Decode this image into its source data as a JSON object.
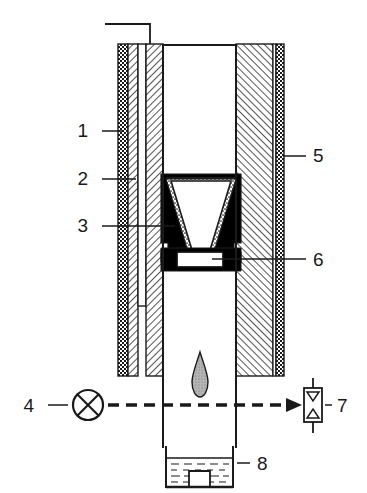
{
  "figure": {
    "type": "technical-line-drawing",
    "background_color": "#ffffff",
    "line_color": "#1a1a1a"
  },
  "callouts": [
    {
      "id": "1",
      "label": "1",
      "side": "left",
      "text_x": 88,
      "text_y": 137,
      "leader_x1": 102,
      "leader_x2": 124,
      "leader_y": 131,
      "target": "outer-checkered-jacket"
    },
    {
      "id": "2",
      "label": "2",
      "side": "left",
      "text_x": 88,
      "text_y": 185,
      "leader_x1": 102,
      "leader_x2": 136,
      "leader_y": 179,
      "target": "inner-hatched-liner"
    },
    {
      "id": "3",
      "label": "3",
      "side": "left",
      "text_x": 88,
      "text_y": 232,
      "leader_x1": 102,
      "leader_x2": 175,
      "leader_y": 226,
      "target": "stippled-cone-packing"
    },
    {
      "id": "4",
      "label": "4",
      "side": "left",
      "text_x": 34,
      "text_y": 412,
      "leader_x1": 48,
      "leader_x2": 68,
      "leader_y": 405,
      "target": "gas-supply-valve"
    },
    {
      "id": "5",
      "label": "5",
      "side": "right",
      "text_x": 313,
      "text_y": 162,
      "leader_x1": 283,
      "leader_x2": 306,
      "leader_y": 156,
      "target": "outer-hatched-shell"
    },
    {
      "id": "6",
      "label": "6",
      "side": "right",
      "text_x": 313,
      "text_y": 266,
      "leader_x1": 212,
      "leader_x2": 306,
      "leader_y": 259,
      "target": "crucible-support-pedestal"
    },
    {
      "id": "7",
      "label": "7",
      "side": "right",
      "text_x": 337,
      "text_y": 412,
      "leader_x1": 325,
      "leader_x2": 332,
      "leader_y": 405,
      "target": "flow-meter-valve"
    },
    {
      "id": "8",
      "label": "8",
      "side": "right",
      "text_x": 257,
      "text_y": 470,
      "leader_x1": 237,
      "leader_x2": 250,
      "leader_y": 463,
      "target": "collection-beaker"
    }
  ],
  "parts": {
    "outer_checkered_jacket": {
      "name": "outer-checkered-jacket",
      "pattern": "checkerboard",
      "fill_color": "#1a1a1a"
    },
    "outer_hatched_shell": {
      "name": "outer-hatched-shell",
      "pattern": "diagonal-hatch",
      "fill_color": "#1a1a1a"
    },
    "inner_hatched_liner": {
      "name": "inner-hatched-liner",
      "pattern": "diagonal-hatch",
      "fill_color": "#1a1a1a"
    },
    "thermocouple_channel": {
      "name": "thermocouple-channel",
      "pattern": "none",
      "fill_color": "#ffffff"
    },
    "cone_crucible": {
      "name": "cone-crucible",
      "pattern": "stipple",
      "fill_color": "#ffffff"
    },
    "crucible_support": {
      "name": "crucible-support-pedestal",
      "pattern": "solid",
      "fill_color": "#000000"
    },
    "droplet": {
      "name": "falling-droplet",
      "pattern": "stipple",
      "fill_color": "#9a9a9a"
    },
    "gas_flow_arrow": {
      "name": "gas-flow-arrow",
      "style": "dashed-with-arrowhead",
      "fill_color": "#1a1a1a"
    },
    "collection_beaker": {
      "name": "collection-beaker",
      "liquid_lines": 5,
      "fill_color": "#ffffff"
    }
  },
  "geometry": {
    "furnace_left_outer_x": 118,
    "furnace_right_outer_x": 284,
    "furnace_top_y": 44,
    "furnace_bottom_y": 376,
    "inner_tube_left_x": 163,
    "inner_tube_right_x": 236,
    "inner_tube_bottom_y": 448,
    "cone_top_y": 175,
    "cone_bottom_y": 250,
    "beaker_top_y": 448,
    "beaker_bottom_y": 487
  }
}
